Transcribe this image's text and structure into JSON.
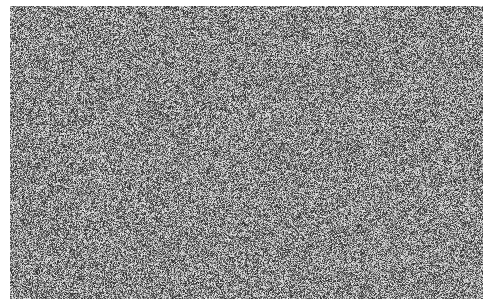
{
  "canvas": {
    "width": 483,
    "height": 299,
    "background": "#ffffff"
  },
  "noise_region": {
    "x": 10,
    "y": 6,
    "width": 473,
    "height": 293,
    "type": "grayscale-static",
    "min_gray": 40,
    "max_gray": 235,
    "seed": 1337
  }
}
